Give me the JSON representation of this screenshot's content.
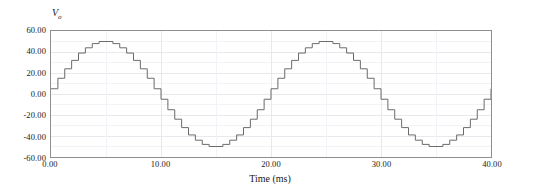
{
  "chart_data": {
    "type": "line",
    "title": "",
    "subtitle": "",
    "xlabel": "Time (ms)",
    "ylabel": "Vo",
    "ylabel_base": "V",
    "ylabel_sub": "o",
    "xlim": [
      0,
      40
    ],
    "ylim": [
      -60,
      60
    ],
    "grid": true,
    "grid_major": true,
    "grid_minor": true,
    "legend": "none",
    "line_color": "#6b6b6b",
    "grid_color": "#e8e8ee",
    "grid_minor_color": "#f3f3f7",
    "frame_color": "#8e8e8e",
    "background": "#ffffff",
    "step_mode": "post",
    "xticks": [
      0,
      10,
      20,
      30,
      40
    ],
    "xtick_labels": [
      "0.00",
      "10.00",
      "20.00",
      "30.00",
      "40.00"
    ],
    "yticks": [
      60,
      40,
      20,
      0,
      -20,
      -40,
      -60
    ],
    "ytick_labels": [
      "60.00",
      "40.00",
      "20.00",
      "0.00",
      "-20.00",
      "-40.00",
      "-60.00"
    ],
    "period_ms": 20,
    "cycles": 2,
    "amplitude": 50,
    "steps_per_period": 32,
    "step_width_ms": 0.625,
    "x": [
      0,
      0.625,
      1.25,
      1.875,
      2.5,
      3.125,
      3.75,
      4.375,
      5,
      5.625,
      6.25,
      6.875,
      7.5,
      8.125,
      8.75,
      9.375,
      10,
      10.625,
      11.25,
      11.875,
      12.5,
      13.125,
      13.75,
      14.375,
      15,
      15.625,
      16.25,
      16.875,
      17.5,
      18.125,
      18.75,
      19.375,
      20,
      20.625,
      21.25,
      21.875,
      22.5,
      23.125,
      23.75,
      24.375,
      25,
      25.625,
      26.25,
      26.875,
      27.5,
      28.125,
      28.75,
      29.375,
      30,
      30.625,
      31.25,
      31.875,
      32.5,
      33.125,
      33.75,
      34.375,
      35,
      35.625,
      36.25,
      36.875,
      37.5,
      38.125,
      38.75,
      39.375,
      40
    ],
    "values": [
      5,
      15,
      24,
      32,
      39,
      44,
      48,
      50,
      50,
      48,
      44,
      39,
      32,
      24,
      15,
      5,
      -5,
      -15,
      -24,
      -32,
      -39,
      -44,
      -48,
      -50,
      -50,
      -48,
      -44,
      -39,
      -32,
      -24,
      -15,
      -5,
      5,
      15,
      24,
      32,
      39,
      44,
      48,
      50,
      50,
      48,
      44,
      39,
      32,
      24,
      15,
      5,
      -5,
      -15,
      -24,
      -32,
      -39,
      -44,
      -48,
      -50,
      -50,
      -48,
      -44,
      -39,
      -32,
      -24,
      -15,
      -5,
      5
    ],
    "yunit": "V",
    "xunit": "ms"
  }
}
